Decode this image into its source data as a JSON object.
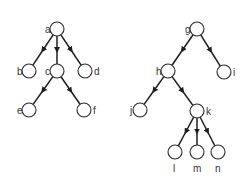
{
  "trees": [
    {
      "name": "left-tree",
      "nodes": [
        {
          "id": "a",
          "label": "a",
          "x": 57,
          "y": 29,
          "lx": -12,
          "ly": 4
        },
        {
          "id": "b",
          "label": "b",
          "x": 29,
          "y": 71,
          "lx": -12,
          "ly": 4
        },
        {
          "id": "c",
          "label": "c",
          "x": 57,
          "y": 71,
          "lx": -12,
          "ly": 4
        },
        {
          "id": "d",
          "label": "d",
          "x": 85,
          "y": 71,
          "lx": 9,
          "ly": 4
        },
        {
          "id": "e",
          "label": "e",
          "x": 29,
          "y": 110,
          "lx": -12,
          "ly": 4
        },
        {
          "id": "f",
          "label": "f",
          "x": 84,
          "y": 110,
          "lx": 9,
          "ly": 4
        }
      ],
      "edges": [
        [
          "a",
          "b"
        ],
        [
          "a",
          "c"
        ],
        [
          "a",
          "d"
        ],
        [
          "c",
          "e"
        ],
        [
          "c",
          "f"
        ]
      ]
    },
    {
      "name": "right-tree",
      "nodes": [
        {
          "id": "g",
          "label": "g",
          "x": 197,
          "y": 29,
          "lx": -12,
          "ly": 4
        },
        {
          "id": "h",
          "label": "h",
          "x": 168,
          "y": 71,
          "lx": -12,
          "ly": 4
        },
        {
          "id": "i",
          "label": "i",
          "x": 224,
          "y": 72,
          "lx": 9,
          "ly": 4
        },
        {
          "id": "j",
          "label": "j",
          "x": 140,
          "y": 110,
          "lx": -10,
          "ly": 4
        },
        {
          "id": "k",
          "label": "k",
          "x": 197,
          "y": 111,
          "lx": 9,
          "ly": 4
        },
        {
          "id": "l",
          "label": "l",
          "x": 175,
          "y": 152,
          "lx": -2,
          "ly": 20
        },
        {
          "id": "m",
          "label": "m",
          "x": 197,
          "y": 152,
          "lx": -4,
          "ly": 20
        },
        {
          "id": "n",
          "label": "n",
          "x": 218,
          "y": 152,
          "lx": -3,
          "ly": 20
        }
      ],
      "edges": [
        [
          "g",
          "h"
        ],
        [
          "g",
          "i"
        ],
        [
          "h",
          "j"
        ],
        [
          "h",
          "k"
        ],
        [
          "k",
          "l"
        ],
        [
          "k",
          "m"
        ],
        [
          "k",
          "n"
        ]
      ]
    }
  ],
  "style": {
    "node_radius": 7,
    "edge_color": "#1e1e1e"
  }
}
